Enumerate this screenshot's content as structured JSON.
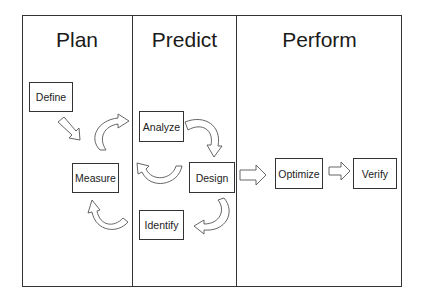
{
  "diagram": {
    "phases": [
      {
        "title": "Plan"
      },
      {
        "title": "Predict"
      },
      {
        "title": "Perform"
      }
    ],
    "steps": [
      {
        "label": "Define",
        "phase": "Plan"
      },
      {
        "label": "Measure",
        "phase": "Plan"
      },
      {
        "label": "Analyze",
        "phase": "Predict"
      },
      {
        "label": "Design",
        "phase": "Predict"
      },
      {
        "label": "Identify",
        "phase": "Predict"
      },
      {
        "label": "Optimize",
        "phase": "Perform"
      },
      {
        "label": "Verify",
        "phase": "Perform"
      }
    ],
    "flow": [
      {
        "from": "Define",
        "to": "Measure",
        "style": "straight-block-arrow"
      },
      {
        "from": "Measure",
        "to": "Analyze",
        "style": "curved-block-arrow"
      },
      {
        "from": "Analyze",
        "to": "Design",
        "style": "curved-block-arrow"
      },
      {
        "from": "Design",
        "to": "Measure",
        "style": "curved-block-arrow"
      },
      {
        "from": "Design",
        "to": "Identify",
        "style": "curved-block-arrow"
      },
      {
        "from": "Identify",
        "to": "Measure",
        "style": "curved-block-arrow"
      },
      {
        "from": "Design",
        "to": "Optimize",
        "style": "straight-block-arrow"
      },
      {
        "from": "Optimize",
        "to": "Verify",
        "style": "straight-block-arrow"
      }
    ],
    "colors": {
      "line": "#333333",
      "background": "#ffffff"
    }
  }
}
